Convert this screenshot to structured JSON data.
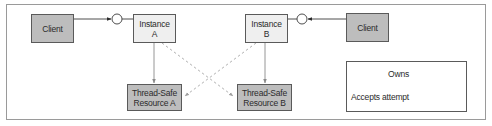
{
  "diagram": {
    "nodes": {
      "client_left": {
        "label": "Client"
      },
      "instance_a": {
        "label": "Instance\nA"
      },
      "instance_b": {
        "label": "Instance\nB"
      },
      "client_right": {
        "label": "Client"
      },
      "resource_a": {
        "label": "Thread-Safe\nResource A"
      },
      "resource_b": {
        "label": "Thread-Safe\nResource B"
      }
    },
    "edges": [
      {
        "from": "client_left",
        "to": "instance_a",
        "type": "interface-call"
      },
      {
        "from": "client_right",
        "to": "instance_b",
        "type": "interface-call"
      },
      {
        "from": "instance_a",
        "to": "resource_a",
        "type": "owns"
      },
      {
        "from": "instance_b",
        "to": "resource_b",
        "type": "owns"
      },
      {
        "from": "instance_a",
        "to": "resource_b",
        "type": "accepts-attempt"
      },
      {
        "from": "instance_b",
        "to": "resource_a",
        "type": "accepts-attempt"
      }
    ],
    "legend": {
      "owns": "Owns",
      "accepts_attempt": "Accepts attempt"
    },
    "colors": {
      "client_fill": "#bdbdbd",
      "instance_fill": "#efefef",
      "resource_fill": "#bdbdbd",
      "border": "#5a5a5a",
      "owns_line": "#8a8a8a",
      "attempt_line": "#a8a8a8"
    }
  }
}
